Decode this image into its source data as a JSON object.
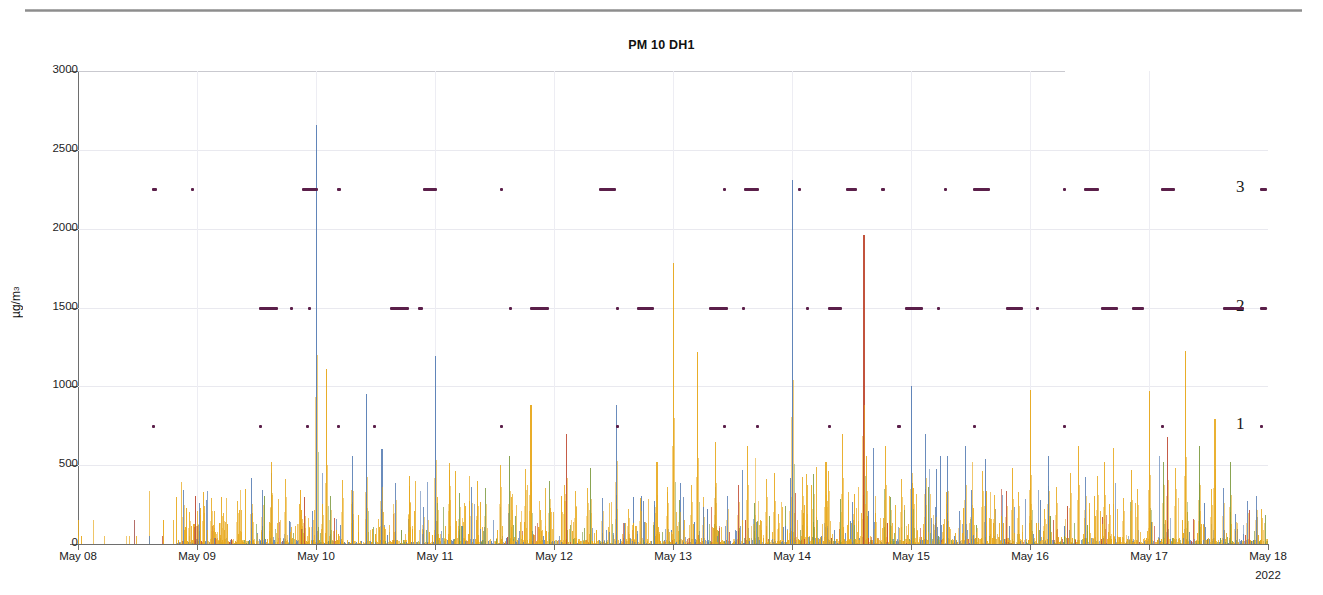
{
  "figure": {
    "title": "PM 10 DH1",
    "y_axis_title": "µg/m",
    "y_axis_title_sup": "3",
    "year_label": "2022"
  },
  "level_annotations": [
    {
      "label": "3",
      "value": 2250
    },
    {
      "label": "2",
      "value": 1500
    },
    {
      "label": "1",
      "value": 750
    }
  ],
  "chart_data": {
    "type": "line",
    "title": "PM 10 DH1",
    "xlabel": "",
    "ylabel": "µg/m3",
    "ylim": [
      0,
      3000
    ],
    "yticks": [
      0,
      500,
      1000,
      1500,
      2000,
      2500,
      3000
    ],
    "ytick_labels": [
      "0",
      "500",
      "1000",
      "1500",
      "2000",
      "2500",
      "3000"
    ],
    "xlim": [
      "May 08",
      "May 18"
    ],
    "xticks": [
      "May 08",
      "May 09",
      "May 10",
      "May 11",
      "May 12",
      "May 13",
      "May 14",
      "May 15",
      "May 16",
      "May 17",
      "May 18"
    ],
    "year": "2022",
    "grid": true,
    "legend_position": "none",
    "series": [
      {
        "name": "series-orange",
        "color": "#e8a91d"
      },
      {
        "name": "series-blue",
        "color": "#5a7fb5"
      },
      {
        "name": "series-green",
        "color": "#7c9a3f"
      },
      {
        "name": "series-red",
        "color": "#c0392b"
      }
    ],
    "marker_color": "#5b1f4a",
    "notable_peaks": [
      {
        "x": "May 10",
        "value": 2660,
        "series": "series-blue"
      },
      {
        "x": "May 14",
        "value": 2310,
        "series": "series-blue"
      },
      {
        "x": "May 14.6",
        "value": 1960,
        "series": "series-red"
      },
      {
        "x": "May 13",
        "value": 1780,
        "series": "series-orange"
      },
      {
        "x": "May 11",
        "value": 1190,
        "series": "series-blue"
      },
      {
        "x": "May 13.2",
        "value": 1215,
        "series": "series-orange"
      },
      {
        "x": "May 17.3",
        "value": 1225,
        "series": "series-orange"
      },
      {
        "x": "May 10.1",
        "value": 1110,
        "series": "series-orange"
      },
      {
        "x": "May 15",
        "value": 1000,
        "series": "series-blue"
      },
      {
        "x": "May 16",
        "value": 975,
        "series": "series-orange"
      },
      {
        "x": "May 17",
        "value": 970,
        "series": "series-orange"
      },
      {
        "x": "May 10.4",
        "value": 950,
        "series": "series-blue"
      },
      {
        "x": "May 11.8",
        "value": 880,
        "series": "series-orange"
      }
    ],
    "baseline_note": "Dense high-frequency spikes with a near-zero baseline across the full 10-day window; most spikes between 0 and 500."
  }
}
